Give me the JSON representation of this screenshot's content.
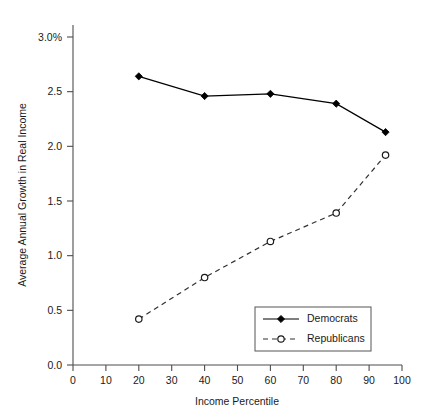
{
  "chart_data": {
    "type": "line",
    "title": "",
    "xlabel": "Income Percentile",
    "ylabel": "Average Annual Growth in Real Income",
    "xlim": [
      0,
      100
    ],
    "ylim": [
      0.0,
      3.0
    ],
    "grid": false,
    "legend_position": "lower-right",
    "x_ticks": [
      "0",
      "10",
      "20",
      "30",
      "40",
      "50",
      "60",
      "70",
      "80",
      "90",
      "100"
    ],
    "x_tick_values": [
      0,
      10,
      20,
      30,
      40,
      50,
      60,
      70,
      80,
      90,
      100
    ],
    "y_ticks": [
      "0.0",
      "0.5",
      "1.0",
      "1.5",
      "2.0",
      "2.5",
      "3.0%"
    ],
    "y_tick_values": [
      0.0,
      0.5,
      1.0,
      1.5,
      2.0,
      2.5,
      3.0
    ],
    "x": [
      20,
      40,
      60,
      80,
      95
    ],
    "series": [
      {
        "name": "Democrats",
        "marker": "filled-diamond",
        "linestyle": "solid",
        "color": "#000000",
        "values": [
          2.64,
          2.46,
          2.48,
          2.39,
          2.13
        ]
      },
      {
        "name": "Republicans",
        "marker": "open-circle",
        "linestyle": "dashed",
        "color": "#303030",
        "values": [
          0.42,
          0.8,
          1.13,
          1.39,
          1.92
        ]
      }
    ]
  },
  "legend": {
    "entries": [
      {
        "label": "Democrats"
      },
      {
        "label": "Republicans"
      }
    ]
  },
  "colors": {
    "background": "#ffffff",
    "axis": "#4d4d4d",
    "text": "#1a1a1a",
    "democrats": "#000000",
    "republicans": "#303030"
  }
}
